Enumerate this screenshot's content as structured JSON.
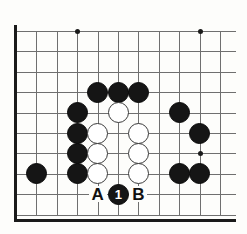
{
  "diagram": {
    "kind": "go-board-diagram",
    "board": {
      "columns": 11,
      "rows": 10,
      "origin_x": 16,
      "origin_y": 31,
      "pitch": 20.4,
      "line_color": "#6f6f6f",
      "edge_color": "#1a1a1a",
      "background_color": "#fdfdfb",
      "edges_shown": [
        "left",
        "bottom"
      ],
      "star_points": [
        {
          "col": 3,
          "row": 0
        },
        {
          "col": 9,
          "row": 0
        },
        {
          "col": 9,
          "row": 6
        }
      ]
    },
    "stones": [
      {
        "id": "b1",
        "color": "black",
        "col": 4,
        "row": 3
      },
      {
        "id": "b2",
        "color": "black",
        "col": 5,
        "row": 3
      },
      {
        "id": "b3",
        "color": "black",
        "col": 6,
        "row": 3
      },
      {
        "id": "b4",
        "color": "black",
        "col": 3,
        "row": 4
      },
      {
        "id": "b5",
        "color": "black",
        "col": 8,
        "row": 4
      },
      {
        "id": "b6",
        "color": "black",
        "col": 3,
        "row": 5
      },
      {
        "id": "b7",
        "color": "black",
        "col": 9,
        "row": 5
      },
      {
        "id": "b8",
        "color": "black",
        "col": 3,
        "row": 6
      },
      {
        "id": "b9",
        "color": "black",
        "col": 3,
        "row": 7
      },
      {
        "id": "b10",
        "color": "black",
        "col": 1,
        "row": 7
      },
      {
        "id": "b11",
        "color": "black",
        "col": 8,
        "row": 7
      },
      {
        "id": "b12",
        "color": "black",
        "col": 9,
        "row": 7
      },
      {
        "id": "w1",
        "color": "white",
        "col": 5,
        "row": 4
      },
      {
        "id": "w2",
        "color": "white",
        "col": 4,
        "row": 5
      },
      {
        "id": "w3",
        "color": "white",
        "col": 6,
        "row": 5
      },
      {
        "id": "w4",
        "color": "white",
        "col": 4,
        "row": 6
      },
      {
        "id": "w5",
        "color": "white",
        "col": 6,
        "row": 6
      },
      {
        "id": "w6",
        "color": "white",
        "col": 4,
        "row": 7
      },
      {
        "id": "w7",
        "color": "white",
        "col": 6,
        "row": 7
      }
    ],
    "move_stones": [
      {
        "id": "m1",
        "color": "black",
        "col": 5,
        "row": 8,
        "number": "1"
      }
    ],
    "point_labels": [
      {
        "id": "la",
        "text": "A",
        "col": 4,
        "row": 8
      },
      {
        "id": "lb",
        "text": "B",
        "col": 6,
        "row": 8
      }
    ]
  }
}
